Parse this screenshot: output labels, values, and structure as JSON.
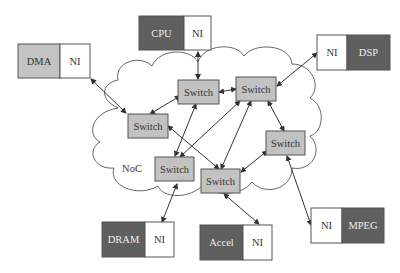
{
  "colors": {
    "dark_core": "#5f5f5f",
    "light_core": "#c4c4c4",
    "switch_fill": "#c2c2c2",
    "ni_fill": "#ffffff",
    "stroke": "#444444",
    "dark_text": "#eeeeee",
    "light_text": "#333333"
  },
  "cloud": {
    "label": "NoC"
  },
  "cores": [
    {
      "id": "cpu",
      "name": "CPU",
      "ni": "NI"
    },
    {
      "id": "dma",
      "name": "DMA",
      "ni": "NI"
    },
    {
      "id": "dsp",
      "name": "DSP",
      "ni": "NI"
    },
    {
      "id": "dram",
      "name": "DRAM",
      "ni": "NI"
    },
    {
      "id": "accel",
      "name": "Accel",
      "ni": "NI"
    },
    {
      "id": "mpeg",
      "name": "MPEG",
      "ni": "NI"
    }
  ],
  "switches": [
    {
      "id": "s1",
      "label": "Switch"
    },
    {
      "id": "s2",
      "label": "Switch"
    },
    {
      "id": "s3",
      "label": "Switch"
    },
    {
      "id": "s4",
      "label": "Switch"
    },
    {
      "id": "s5",
      "label": "Switch"
    },
    {
      "id": "s6",
      "label": "Switch"
    }
  ],
  "links": [
    {
      "from": "cpu.ni",
      "to": "s1"
    },
    {
      "from": "dma.ni",
      "to": "s3"
    },
    {
      "from": "dsp.ni",
      "to": "s2"
    },
    {
      "from": "dram.ni",
      "to": "s5"
    },
    {
      "from": "accel.ni",
      "to": "s6"
    },
    {
      "from": "mpeg.ni",
      "to": "s4"
    },
    {
      "from": "s1",
      "to": "s2"
    },
    {
      "from": "s1",
      "to": "s3"
    },
    {
      "from": "s1",
      "to": "s5"
    },
    {
      "from": "s2",
      "to": "s5"
    },
    {
      "from": "s2",
      "to": "s6"
    },
    {
      "from": "s2",
      "to": "s4"
    },
    {
      "from": "s3",
      "to": "s6"
    },
    {
      "from": "s4",
      "to": "s6"
    }
  ]
}
